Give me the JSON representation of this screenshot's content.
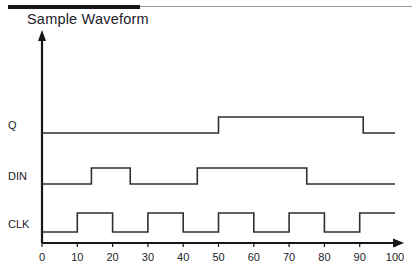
{
  "header": {
    "title": "Sample Waveform",
    "rule_thick_color": "#16161a",
    "rule_thin_color": "#9a9a9e"
  },
  "chart_data": {
    "type": "line",
    "title": "Sample Waveform",
    "xlabel": "",
    "ylabel": "",
    "xlim": [
      0,
      100
    ],
    "grid": false,
    "legend": "none",
    "x_ticks": [
      0,
      10,
      20,
      30,
      40,
      50,
      60,
      70,
      80,
      90,
      100
    ],
    "x_tick_labels": [
      "0",
      "10",
      "20",
      "30",
      "40",
      "50",
      "60",
      "70",
      "80",
      "90",
      "100"
    ],
    "signal_color": "#2f2f34",
    "axis_color": "#16161a",
    "series": [
      {
        "name": "Q",
        "label": "Q",
        "row": 0,
        "initial_level": 0,
        "transitions": [
          {
            "x": 50,
            "level": 1
          },
          {
            "x": 91,
            "level": 0
          }
        ],
        "values": [
          {
            "x": 0,
            "y": 0
          },
          {
            "x": 50,
            "y": 0
          },
          {
            "x": 50,
            "y": 1
          },
          {
            "x": 91,
            "y": 1
          },
          {
            "x": 91,
            "y": 0
          },
          {
            "x": 100,
            "y": 0
          }
        ]
      },
      {
        "name": "DIN",
        "label": "DIN",
        "row": 1,
        "initial_level": 0,
        "transitions": [
          {
            "x": 14,
            "level": 1
          },
          {
            "x": 25,
            "level": 0
          },
          {
            "x": 44,
            "level": 1
          },
          {
            "x": 75,
            "level": 0
          }
        ],
        "values": [
          {
            "x": 0,
            "y": 0
          },
          {
            "x": 14,
            "y": 0
          },
          {
            "x": 14,
            "y": 1
          },
          {
            "x": 25,
            "y": 1
          },
          {
            "x": 25,
            "y": 0
          },
          {
            "x": 44,
            "y": 0
          },
          {
            "x": 44,
            "y": 1
          },
          {
            "x": 75,
            "y": 1
          },
          {
            "x": 75,
            "y": 0
          },
          {
            "x": 100,
            "y": 0
          }
        ]
      },
      {
        "name": "CLK",
        "label": "CLK",
        "row": 2,
        "initial_level": 0,
        "transitions": [
          {
            "x": 10,
            "level": 1
          },
          {
            "x": 20,
            "level": 0
          },
          {
            "x": 30,
            "level": 1
          },
          {
            "x": 40,
            "level": 0
          },
          {
            "x": 50,
            "level": 1
          },
          {
            "x": 60,
            "level": 0
          },
          {
            "x": 70,
            "level": 1
          },
          {
            "x": 80,
            "level": 0
          },
          {
            "x": 90,
            "level": 1
          }
        ],
        "values": [
          {
            "x": 0,
            "y": 0
          },
          {
            "x": 10,
            "y": 0
          },
          {
            "x": 10,
            "y": 1
          },
          {
            "x": 20,
            "y": 1
          },
          {
            "x": 20,
            "y": 0
          },
          {
            "x": 30,
            "y": 0
          },
          {
            "x": 30,
            "y": 1
          },
          {
            "x": 40,
            "y": 1
          },
          {
            "x": 40,
            "y": 0
          },
          {
            "x": 50,
            "y": 0
          },
          {
            "x": 50,
            "y": 1
          },
          {
            "x": 60,
            "y": 1
          },
          {
            "x": 60,
            "y": 0
          },
          {
            "x": 70,
            "y": 0
          },
          {
            "x": 70,
            "y": 1
          },
          {
            "x": 80,
            "y": 1
          },
          {
            "x": 80,
            "y": 0
          },
          {
            "x": 90,
            "y": 0
          },
          {
            "x": 90,
            "y": 1
          },
          {
            "x": 100,
            "y": 1
          }
        ]
      }
    ]
  }
}
